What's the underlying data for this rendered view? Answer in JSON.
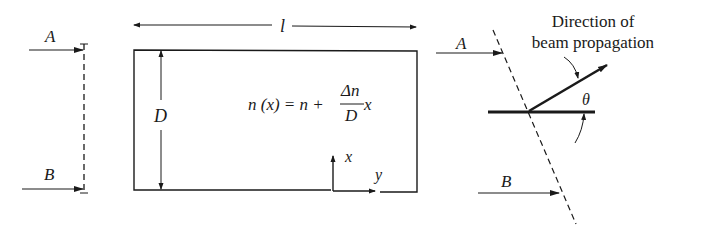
{
  "diagram": {
    "left_wavefront": {
      "ray_top_label": "A",
      "ray_bottom_label": "B",
      "style": "dashed vertical"
    },
    "slab": {
      "length_label": "l",
      "thickness_label": "D",
      "equation": {
        "lhs": "n (x) = n + ",
        "frac_num": "Δn",
        "frac_den": "D",
        "rhs": " x"
      },
      "axes": {
        "x_label": "x",
        "y_label": "y"
      }
    },
    "right_wavefront": {
      "ray_top_label": "A",
      "ray_bottom_label": "B",
      "style": "dashed tilted",
      "direction_label_line1": "Direction of",
      "direction_label_line2": "beam propagation",
      "angle_label": "θ"
    },
    "colors": {
      "ink": "#1a1a1a",
      "background": "#ffffff"
    }
  }
}
